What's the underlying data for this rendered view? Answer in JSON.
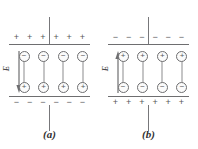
{
  "figure": {
    "colors": {
      "line": "#6e6e70",
      "wire": "#77777a",
      "sign": "#57575a",
      "circle_stroke": "#6e6e70",
      "circle_fill": "#fbfbfb",
      "caption": "#303033",
      "background": "#ffffff"
    }
  },
  "panels": [
    {
      "id": "a",
      "caption": "(a)",
      "top_plate": {
        "polarity": "positive",
        "signs": [
          "+",
          "+",
          "+",
          "+",
          "+",
          "+"
        ]
      },
      "bottom_plate": {
        "polarity": "negative",
        "signs": [
          "−",
          "−",
          "−",
          "−",
          "−",
          "−"
        ]
      },
      "field": {
        "label": "E",
        "direction": "down",
        "arrow_glyph": "down-arrow"
      },
      "dipoles": [
        {
          "top_charge": "−",
          "bottom_charge": "+"
        },
        {
          "top_charge": "−",
          "bottom_charge": "+"
        },
        {
          "top_charge": "−",
          "bottom_charge": "+"
        },
        {
          "top_charge": "−",
          "bottom_charge": "+"
        }
      ],
      "leads": {
        "top": true,
        "bottom": true
      }
    },
    {
      "id": "b",
      "caption": "(b)",
      "top_plate": {
        "polarity": "negative",
        "signs": [
          "−",
          "−",
          "−",
          "−",
          "−",
          "−"
        ]
      },
      "bottom_plate": {
        "polarity": "positive",
        "signs": [
          "+",
          "+",
          "+",
          "+",
          "+",
          "+"
        ]
      },
      "field": {
        "label": "E",
        "direction": "up",
        "arrow_glyph": "up-arrow"
      },
      "dipoles": [
        {
          "top_charge": "+",
          "bottom_charge": "−"
        },
        {
          "top_charge": "+",
          "bottom_charge": "−"
        },
        {
          "top_charge": "+",
          "bottom_charge": "−"
        },
        {
          "top_charge": "+",
          "bottom_charge": "−"
        }
      ],
      "leads": {
        "top": true,
        "bottom": true
      }
    }
  ]
}
